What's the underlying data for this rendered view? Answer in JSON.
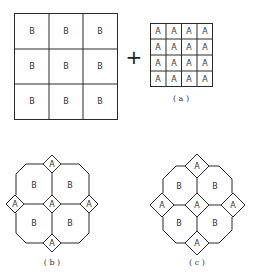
{
  "figure_a": {
    "big_grid": {
      "rows": 3,
      "cols": 3,
      "cell_label": "B",
      "cells": [
        "B",
        "B",
        "B",
        "B",
        "B",
        "B",
        "B",
        "B",
        "B"
      ]
    },
    "operator": "+",
    "small_grid": {
      "rows": 4,
      "cols": 4,
      "cell_label": "A",
      "cells": [
        "A",
        "A",
        "A",
        "A",
        "A",
        "A",
        "A",
        "A",
        "A",
        "A",
        "A",
        "A",
        "A",
        "A",
        "A",
        "A"
      ]
    },
    "caption": "( a )"
  },
  "figure_b": {
    "octagon_labels": [
      "B",
      "B",
      "B",
      "B"
    ],
    "diamond_labels": [
      "A",
      "A",
      "A",
      "A",
      "A"
    ],
    "caption": "( b )"
  },
  "figure_c": {
    "octagon_labels": [
      "B",
      "B",
      "B",
      "B"
    ],
    "diamond_labels": [
      "A",
      "A",
      "A",
      "A",
      "A"
    ],
    "caption": "( c )"
  }
}
